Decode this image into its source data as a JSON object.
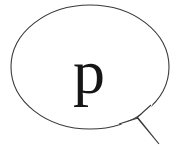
{
  "canvas": {
    "width": 180,
    "height": 159,
    "background_color": "#ffffff"
  },
  "speech_bubble": {
    "label": "speech balloon",
    "stroke_color": "#3a3a3a",
    "stroke_width": 1,
    "fill_color": "#ffffff",
    "ellipse": {
      "center_x": 90,
      "center_y": 67,
      "radius_x": 79,
      "radius_y": 62
    },
    "tail": {
      "attach_left_x": 119,
      "attach_left_y": 124,
      "attach_right_x": 151,
      "attach_right_y": 105,
      "bend_x": 138,
      "bend_y": 118,
      "tip_x": 159,
      "tip_y": 144
    },
    "content": {
      "text": "p",
      "color": "#161616"
    }
  }
}
